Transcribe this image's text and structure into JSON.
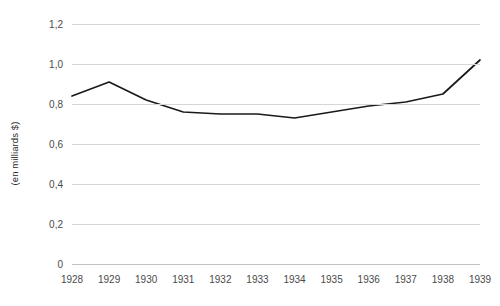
{
  "chart_data": {
    "type": "line",
    "title": "",
    "subtitle": "",
    "xlabel": "",
    "ylabel": "(en milliards $)",
    "categories": [
      "1928",
      "1929",
      "1930",
      "1931",
      "1932",
      "1933",
      "1934",
      "1935",
      "1936",
      "1937",
      "1938",
      "1939"
    ],
    "x": [
      1928,
      1929,
      1930,
      1931,
      1932,
      1933,
      1934,
      1935,
      1936,
      1937,
      1938,
      1939
    ],
    "values": [
      0.84,
      0.91,
      0.82,
      0.76,
      0.75,
      0.75,
      0.73,
      0.76,
      0.79,
      0.81,
      0.85,
      1.02
    ],
    "series": [
      {
        "name": "",
        "values": [
          0.84,
          0.91,
          0.82,
          0.76,
          0.75,
          0.75,
          0.73,
          0.76,
          0.79,
          0.81,
          0.85,
          1.02
        ]
      }
    ],
    "ylim": [
      0,
      1.2
    ],
    "yticks": [
      0,
      0.2,
      0.4,
      0.6,
      0.8,
      1.0,
      1.2
    ],
    "ytick_labels": [
      "0",
      "0,2",
      "0,4",
      "0,6",
      "0,8",
      "1,0",
      "1,2"
    ],
    "grid": true,
    "grid_axis": "y",
    "legend": "none",
    "line_color": "#1a1a1a",
    "grid_color": "#d6d6d6",
    "axis_text_color": "#4a4a4a",
    "background": "#ffffff"
  }
}
